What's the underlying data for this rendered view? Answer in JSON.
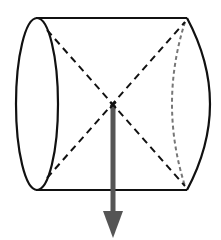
{
  "diagram": {
    "type": "cylinder-center-of-mass",
    "colors": {
      "background": "#ffffff",
      "outline": "#111111",
      "dashed": "#111111",
      "hidden_edge": "#777777",
      "arrow": "#555555"
    },
    "cylinder": {
      "top_edge": {
        "x1": 36,
        "y1": 18,
        "x2": 187,
        "y2": 18
      },
      "bottom_edge": {
        "x1": 36,
        "y1": 190,
        "x2": 187,
        "y2": 190
      },
      "left_face": {
        "cx": 37,
        "cy": 104,
        "rx": 21,
        "ry": 86
      },
      "right_face_visible_arc": {
        "x_top": 187,
        "y_top": 18,
        "x_bottom": 187,
        "y_bottom": 190,
        "bulge_x": 210
      },
      "right_face_hidden_arc": {
        "x_top": 185,
        "y_top": 22,
        "x_bottom": 185,
        "y_bottom": 186,
        "bulge_x": 172
      }
    },
    "diagonals": [
      {
        "x1": 47,
        "y1": 30,
        "x2": 185,
        "y2": 186
      },
      {
        "x1": 47,
        "y1": 178,
        "x2": 185,
        "y2": 22
      }
    ],
    "center_point": {
      "x": 113,
      "y": 105,
      "label_glyph": "×"
    },
    "arrow": {
      "direction": "down",
      "x": 113,
      "y_start": 105,
      "y_shaft_end": 212,
      "y_tip": 238,
      "head_half_width": 10,
      "shaft_width": 5
    }
  }
}
